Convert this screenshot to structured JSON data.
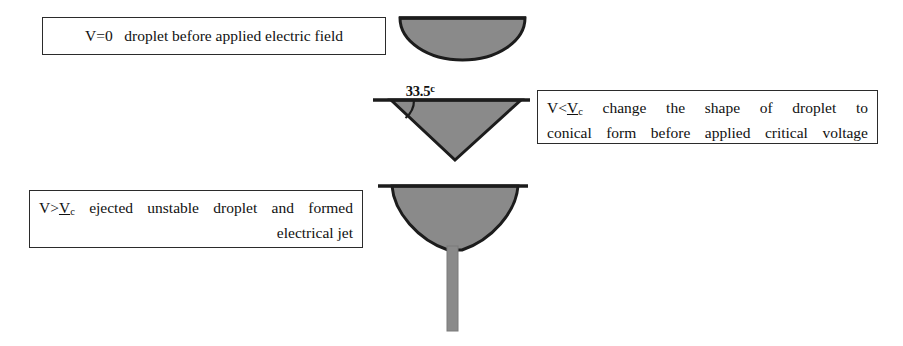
{
  "figure": {
    "shape_fill_color": "#8a8a8a",
    "shape_stroke_color": "#1c1c1c",
    "line_color": "#1c1c1c",
    "box_border_color": "#2b2b2b",
    "background_color": "#ffffff"
  },
  "angle_annotation": {
    "value": "33.5",
    "unit_glyph": "c",
    "full_text": "33.5c"
  },
  "captions": {
    "stage_1": {
      "text": "V=0   droplet before applied electric field",
      "condition": "V=0",
      "description": "droplet before applied electric field"
    },
    "stage_2": {
      "condition_prefix": "V<",
      "condition_symbol": "V",
      "condition_subscript": "c",
      "line_a": " change the shape of droplet to",
      "line_b": "conical form before applied critical voltage"
    },
    "stage_3": {
      "condition_prefix": "V>",
      "condition_symbol": "V",
      "condition_subscript": "c",
      "line_a": " ejected unstable droplet and formed",
      "line_b": "electrical jet"
    }
  },
  "shapes": {
    "stage_1_label": "hemispherical droplet",
    "stage_2_label": "conical droplet",
    "stage_3_label": "taylor cone with electrical jet"
  }
}
